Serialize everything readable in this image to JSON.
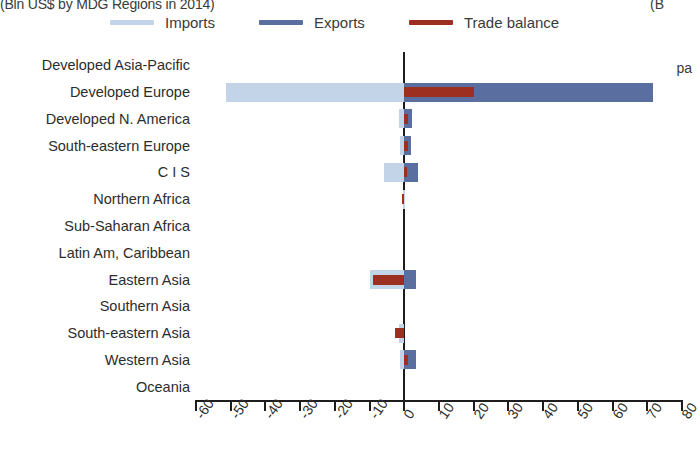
{
  "figure": {
    "title": "(Bln US$ by MDG Regions in 2014)",
    "title_right_fragment": "(B",
    "side_fragment": "pa"
  },
  "legend": {
    "position": "top",
    "items": [
      {
        "label": "Imports",
        "color": "#c3d4e8",
        "icon": "line-swatch"
      },
      {
        "label": "Exports",
        "color": "#5a6fa0",
        "icon": "line-swatch"
      },
      {
        "label": "Trade balance",
        "color": "#9c2f20",
        "icon": "line-swatch"
      }
    ]
  },
  "chart_data": {
    "type": "bar",
    "orientation": "horizontal",
    "title": "(Bln US$ by MDG Regions in 2014)",
    "xlabel": "",
    "ylabel": "",
    "xlim": [
      -60,
      80
    ],
    "xticks": [
      -60,
      -50,
      -40,
      -30,
      -20,
      -10,
      0,
      10,
      20,
      30,
      40,
      50,
      60,
      70,
      80
    ],
    "xticklabels": [
      "-60",
      "-50",
      "-40",
      "-30",
      "-20",
      "-10",
      "0",
      "10",
      "20",
      "30",
      "40",
      "50",
      "60",
      "70",
      "80"
    ],
    "grid": false,
    "zero_line": true,
    "categories": [
      "Developed Asia-Pacific",
      "Developed Europe",
      "Developed N. America",
      "South-eastern Europe",
      "C I S",
      "Northern Africa",
      "Sub-Saharan Africa",
      "Latin Am, Caribbean",
      "Eastern Asia",
      "Southern Asia",
      "South-eastern Asia",
      "Western Asia",
      "Oceania"
    ],
    "series": [
      {
        "name": "Imports",
        "color": "#c3d4e8",
        "values": [
          0,
          -51.4,
          -1.4,
          -1.1,
          -5.7,
          -0.3,
          0,
          0,
          -10.0,
          0,
          -1.4,
          -1.1,
          0
        ]
      },
      {
        "name": "Exports",
        "color": "#5a6fa0",
        "values": [
          0,
          71.7,
          2.3,
          2.0,
          4.0,
          0,
          0,
          0,
          3.4,
          0,
          0,
          3.4,
          0
        ]
      },
      {
        "name": "Trade balance",
        "color": "#9c2f20",
        "values": [
          0,
          20.0,
          1.1,
          1.1,
          0.9,
          -0.6,
          0,
          0,
          -9.1,
          0,
          -2.6,
          1.1,
          0
        ]
      }
    ]
  }
}
